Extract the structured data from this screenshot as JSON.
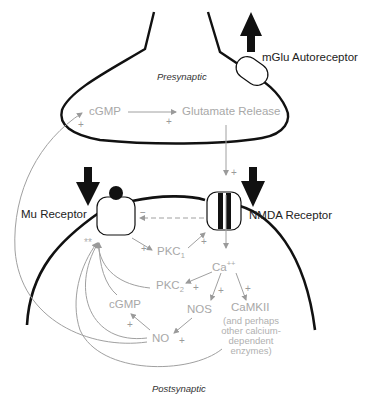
{
  "diagram": {
    "regions": {
      "presynaptic": "Presynaptic",
      "postsynaptic": "Postsynaptic"
    },
    "receptors": {
      "mglu": "mGlu Autoreceptor",
      "mu": "Mu Receptor",
      "nmda": "NMDA Receptor"
    },
    "nodes": {
      "cgmp_pre": "cGMP",
      "glutamate_release": "Glutamate Release",
      "pkc1": "PKC",
      "pkc1_sub": "1",
      "pkc2": "PKC",
      "pkc2_sub": "2",
      "ca": "Ca",
      "ca_sup": "++",
      "cgmp_post": "cGMP",
      "nos": "NOS",
      "no": "NO",
      "camkii": "CaMKII",
      "camkii_note": [
        "(and perhaps",
        "other calcium-",
        "dependent",
        "enzymes)"
      ]
    },
    "signs": {
      "plus": "+",
      "minus": "−",
      "double_star": "**"
    },
    "colors": {
      "membrane": "#111111",
      "pathway": "#a8a8a8",
      "receptor_arrow": "#111111"
    }
  }
}
